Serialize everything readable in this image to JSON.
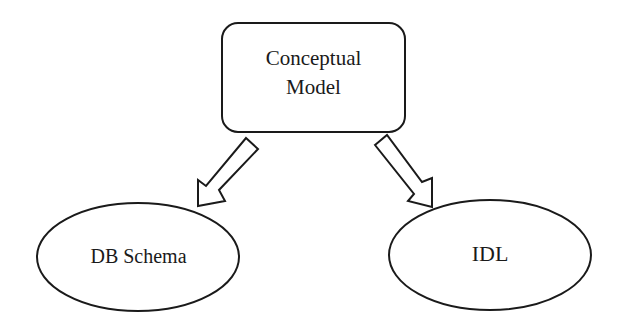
{
  "diagram": {
    "top_node": {
      "line1": "Conceptual",
      "line2": "Model",
      "shape": "rounded-rectangle"
    },
    "left_node": {
      "label": "DB Schema",
      "shape": "ellipse"
    },
    "right_node": {
      "label": "IDL",
      "shape": "ellipse"
    },
    "edges": [
      {
        "from": "Conceptual Model",
        "to": "DB Schema",
        "style": "hollow-block-arrow"
      },
      {
        "from": "Conceptual Model",
        "to": "IDL",
        "style": "hollow-block-arrow"
      }
    ],
    "colors": {
      "stroke": "#1a1a1a",
      "background": "#ffffff"
    }
  }
}
